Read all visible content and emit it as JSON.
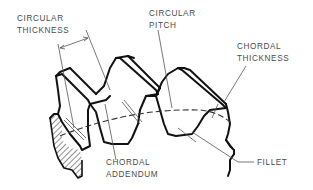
{
  "diagram": {
    "colors": {
      "outline": "#111111",
      "leader": "#555555",
      "text": "#4a4a4a",
      "background": "#ffffff"
    },
    "labels": {
      "circular_thickness": {
        "line1": "CIRCULAR",
        "line2": "THICKNESS"
      },
      "circular_pitch": {
        "line1": "CIRCULAR",
        "line2": "PITCH"
      },
      "chordal_thickness": {
        "line1": "CHORDAL",
        "line2": "THICKNESS"
      },
      "chordal_addendum": {
        "line1": "CHORDAL",
        "line2": "ADDENDUM"
      },
      "fillet": {
        "line1": "FILLET"
      }
    }
  }
}
